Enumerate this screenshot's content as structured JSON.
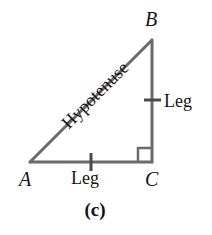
{
  "figure": {
    "caption": "(c)",
    "background_color": "#ffffff",
    "stroke_color": "#6b6b6b",
    "text_color": "#141414",
    "stroke_width": 3,
    "shape": "right-triangle",
    "vertices": [
      {
        "name": "B",
        "label": "B",
        "x": 152,
        "y": 40
      },
      {
        "name": "A",
        "label": "A",
        "x": 30,
        "y": 162
      },
      {
        "name": "C",
        "label": "C",
        "x": 152,
        "y": 162
      }
    ],
    "sides": [
      {
        "name": "hypotenuse",
        "label": "Hypotenuse",
        "from": "A",
        "to": "B",
        "rotation_deg": -45,
        "tick_marks": 0
      },
      {
        "name": "vertical-leg",
        "label": "Leg",
        "from": "B",
        "to": "C",
        "tick_marks": 1
      },
      {
        "name": "horizontal-leg",
        "label": "Leg",
        "from": "A",
        "to": "C",
        "tick_marks": 1
      }
    ],
    "right_angle": {
      "at_vertex": "C",
      "marker": "square",
      "size": 14
    }
  }
}
